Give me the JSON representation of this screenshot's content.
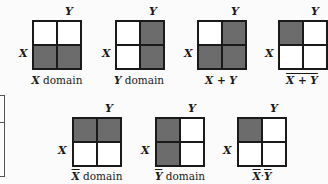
{
  "figure": {
    "axis_labels": {
      "x": "X",
      "y": "Y"
    },
    "diagrams": [
      {
        "id": "x-domain",
        "caption_var": "X",
        "caption_text": " domain",
        "overline": "none",
        "shaded": {
          "tl": false,
          "tr": false,
          "bl": true,
          "br": true
        }
      },
      {
        "id": "y-domain",
        "caption_var": "Y",
        "caption_text": " domain",
        "overline": "none",
        "shaded": {
          "tl": false,
          "tr": true,
          "bl": false,
          "br": true
        }
      },
      {
        "id": "x-or-y",
        "caption_var": "X + Y",
        "caption_text": "",
        "overline": "none",
        "shaded": {
          "tl": false,
          "tr": true,
          "bl": true,
          "br": true
        }
      },
      {
        "id": "not-x-or-y",
        "caption_var": "X + Y",
        "caption_text": "",
        "overline": "whole",
        "shaded": {
          "tl": true,
          "tr": false,
          "bl": false,
          "br": false
        }
      },
      {
        "id": "not-x-domain",
        "caption_var": "X",
        "caption_text": " domain",
        "overline": "var",
        "shaded": {
          "tl": true,
          "tr": true,
          "bl": false,
          "br": false
        }
      },
      {
        "id": "not-y-domain",
        "caption_var": "Y",
        "caption_text": " domain",
        "overline": "var",
        "shaded": {
          "tl": true,
          "tr": false,
          "bl": true,
          "br": false
        }
      },
      {
        "id": "not-x-and-not-y",
        "caption_var": "X·Y",
        "caption_text": "",
        "overline": "each",
        "shaded": {
          "tl": true,
          "tr": false,
          "bl": false,
          "br": false
        }
      }
    ],
    "captions": {
      "d0": "X",
      "d0_suffix": " domain",
      "d1": "Y",
      "d1_suffix": " domain",
      "d2": "X + Y",
      "d3": "X + Y",
      "d4": "X",
      "d4_suffix": " domain",
      "d5": "Y",
      "d5_suffix": " domain",
      "d6_a": "X",
      "d6_dot": "·",
      "d6_b": "Y"
    }
  }
}
